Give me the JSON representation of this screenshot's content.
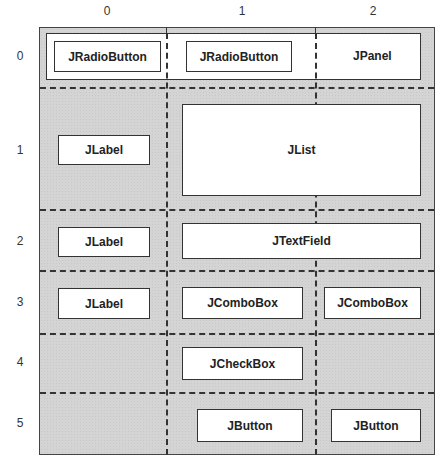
{
  "column_labels": [
    "0",
    "1",
    "2"
  ],
  "row_labels": [
    "0",
    "1",
    "2",
    "3",
    "4",
    "5"
  ],
  "components": {
    "row0": {
      "radio1": "JRadioButton",
      "radio2": "JRadioButton",
      "panel": "JPanel"
    },
    "row1": {
      "label": "JLabel",
      "list": "JList"
    },
    "row2": {
      "label": "JLabel",
      "textfield": "JTextField"
    },
    "row3": {
      "label": "JLabel",
      "combo1": "JComboBox",
      "combo2": "JComboBox"
    },
    "row4": {
      "checkbox": "JCheckBox"
    },
    "row5": {
      "button1": "JButton",
      "button2": "JButton"
    }
  },
  "colors": {
    "grid_background": "#d4d4d4",
    "component_fill": "#ffffff",
    "line": "#333333"
  }
}
